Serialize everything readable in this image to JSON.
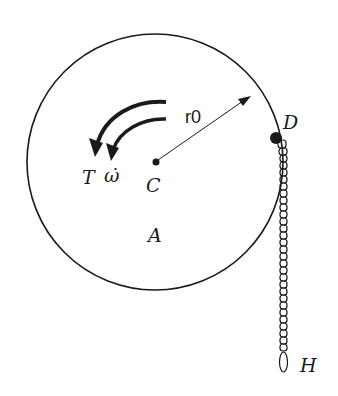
{
  "diagram": {
    "labels": {
      "torque": "T",
      "angular_accel": "ω̇",
      "center": "C",
      "body": "A",
      "radius": "r0",
      "point_d": "D",
      "chain_end": "H"
    },
    "colors": {
      "ink": "#1a1a1a",
      "background": "#ffffff"
    }
  }
}
